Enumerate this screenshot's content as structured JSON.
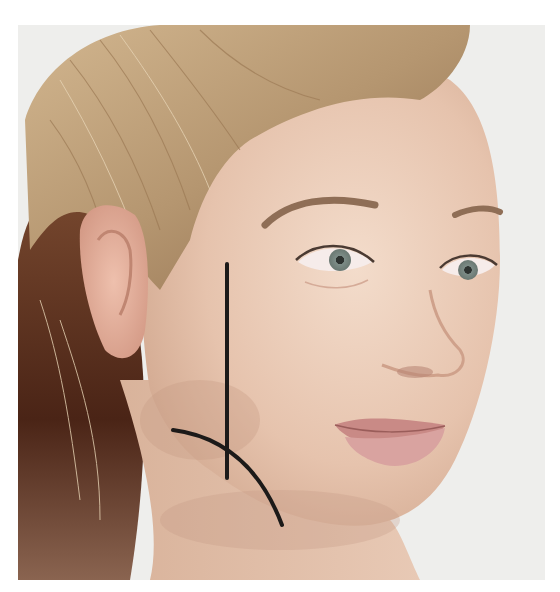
{
  "image": {
    "subject": "woman-face-three-quarter-view",
    "background_color": "#ffffff",
    "photo_background": "#eeeeec",
    "frame": {
      "x": 18,
      "y": 25,
      "width": 527,
      "height": 555
    }
  },
  "colors": {
    "skin_light": "#f0d6c4",
    "skin_mid": "#e2bca4",
    "skin_shadow": "#c79a82",
    "hair_light": "#c9ad86",
    "hair_mid": "#a9875f",
    "hair_dark": "#5a2e1c",
    "lips": "#c98a86",
    "iris": "#7f8c86",
    "brow": "#8a6a52",
    "annotation_line": "#1c1a19"
  },
  "annotations": {
    "vertical_line": {
      "x1": 227,
      "y1": 264,
      "x2": 227,
      "y2": 478,
      "stroke_width": 4
    },
    "jaw_curve": {
      "start": [
        173,
        430
      ],
      "control": [
        250,
        440
      ],
      "end": [
        282,
        525
      ],
      "stroke_width": 4
    }
  }
}
